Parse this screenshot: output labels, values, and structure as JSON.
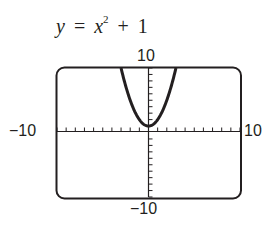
{
  "equation": {
    "lhs": "y",
    "equals": "=",
    "var": "x",
    "exponent": "2",
    "plus": "+",
    "constant": "1"
  },
  "window": {
    "xmin_label": "−10",
    "xmax_label": "10",
    "ymin_label": "−10",
    "ymax_label": "10"
  },
  "chart_data": {
    "type": "line",
    "xlabel": "",
    "ylabel": "",
    "xlim": [
      -10,
      10
    ],
    "ylim": [
      -10,
      10
    ],
    "xscl": 1,
    "yscl": 1,
    "grid": false,
    "legend": null,
    "series": [
      {
        "name": "y = x^2 + 1",
        "x": [
          -3,
          -2.5,
          -2,
          -1.5,
          -1,
          -0.5,
          0,
          0.5,
          1,
          1.5,
          2,
          2.5,
          3
        ],
        "y": [
          10,
          7.25,
          5,
          3.25,
          2,
          1.25,
          1,
          1.25,
          2,
          3.25,
          5,
          7.25,
          10
        ]
      }
    ],
    "annotations": [
      "-10",
      "10",
      "-10",
      "10"
    ]
  },
  "colors": {
    "ink": "#231f20",
    "background": "#ffffff"
  }
}
